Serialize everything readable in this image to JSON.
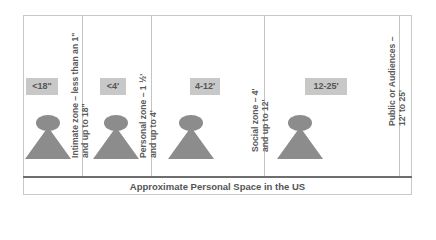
{
  "diagram": {
    "title": "Approximate Personal Space in the US",
    "zones": [
      {
        "distance_label": "<18\"",
        "description_line1": "Intimate zone – less than an 1\"",
        "description_line2": "and up to 18\""
      },
      {
        "distance_label": "<4'",
        "description_line1": "Personal zone – 1 ½'",
        "description_line2": "and up to 4'"
      },
      {
        "distance_label": "4-12'",
        "description_line1": "Social zone – 4'",
        "description_line2": "and up to 12'"
      },
      {
        "distance_label": "12-25'",
        "description_line1": "Public or Audiences –",
        "description_line2": "12' to 25'"
      }
    ],
    "icons": [
      "person-icon",
      "person-icon",
      "person-icon",
      "person-icon"
    ],
    "colors": {
      "figure": "#8c8c8c",
      "label_box": "#c8c8c8",
      "text": "#555555",
      "border": "#c9c9c9"
    }
  }
}
